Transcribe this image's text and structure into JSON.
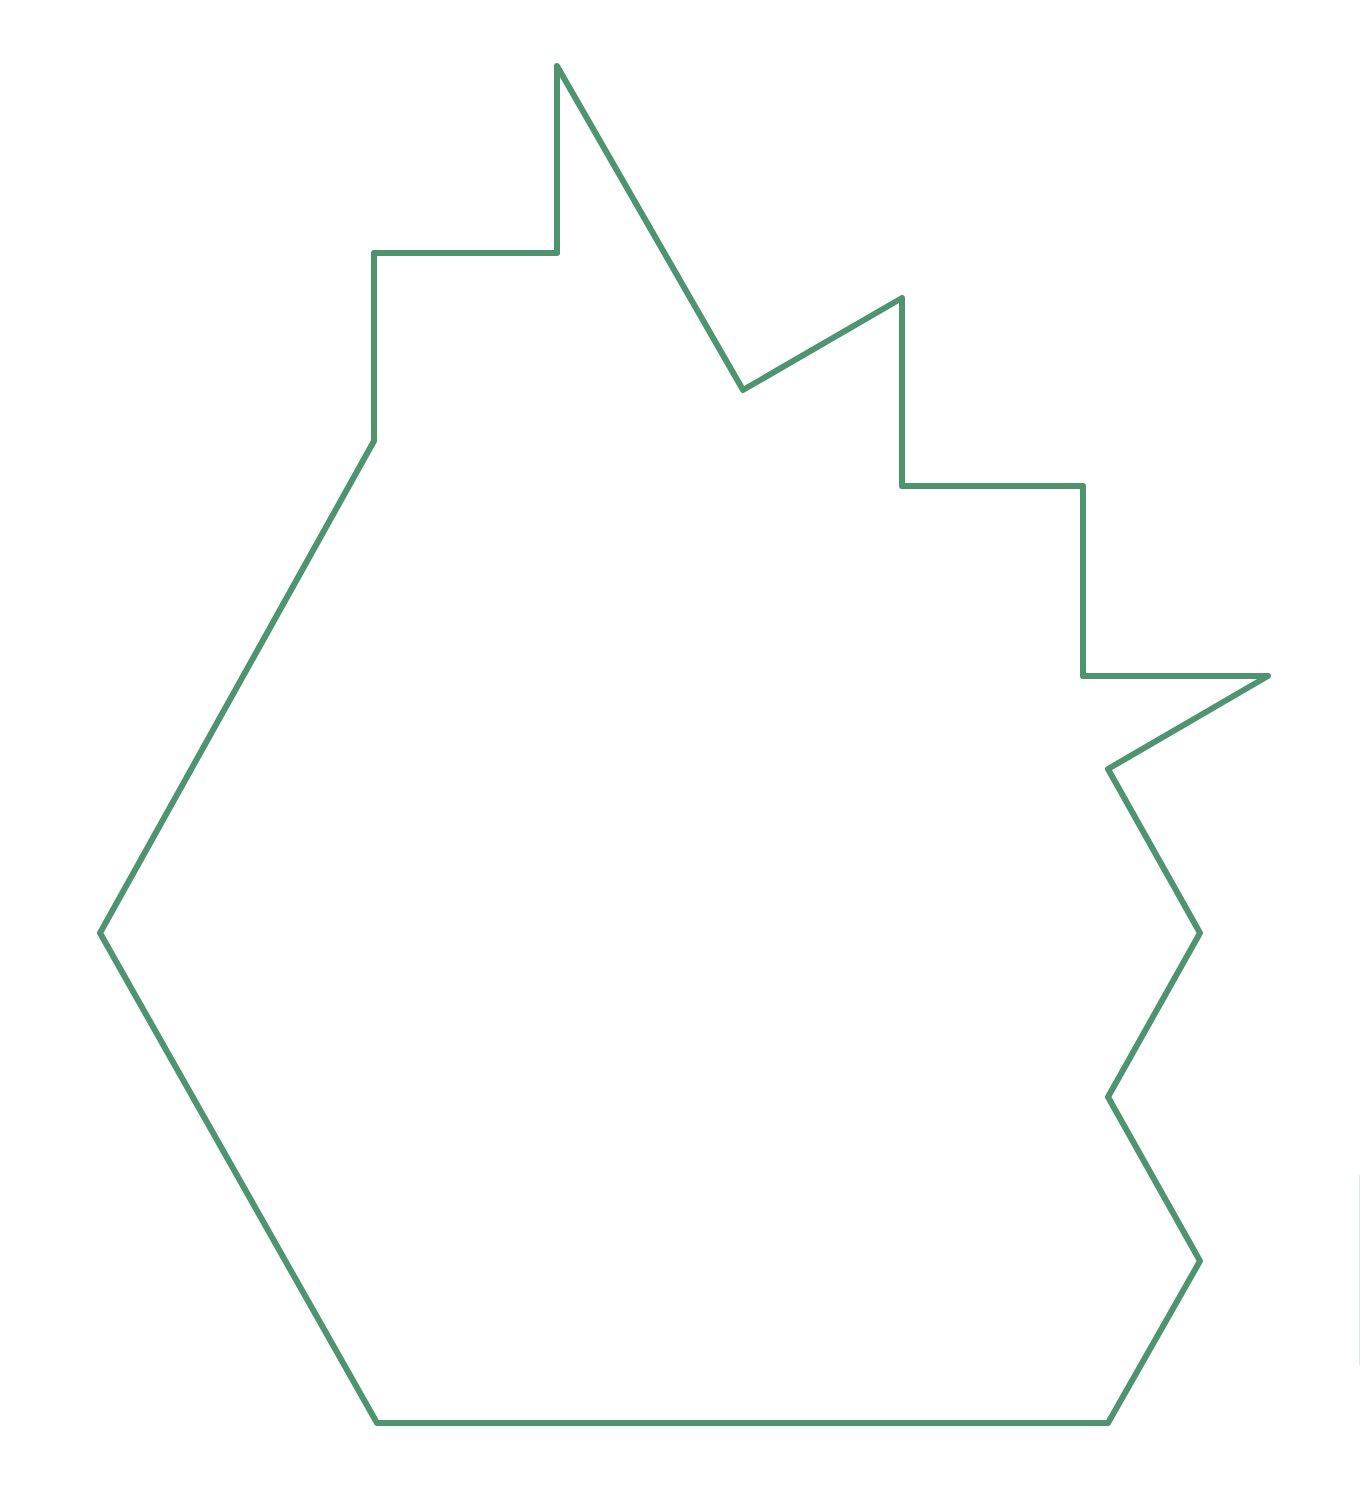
{
  "figure": {
    "type": "polygon-outline",
    "stroke_color": "#4e9470",
    "stroke_width": 6,
    "fill": "none",
    "background": "#ffffff",
    "vertices": [
      [
        557,
        66
      ],
      [
        743,
        390
      ],
      [
        902,
        298
      ],
      [
        902,
        486
      ],
      [
        1083,
        486
      ],
      [
        1083,
        676
      ],
      [
        1268,
        676
      ],
      [
        1108,
        769
      ],
      [
        1200,
        933
      ],
      [
        1108,
        1097
      ],
      [
        1200,
        1261
      ],
      [
        1108,
        1423
      ],
      [
        377,
        1423
      ],
      [
        100,
        933
      ],
      [
        374,
        441
      ],
      [
        374,
        253
      ],
      [
        557,
        253
      ]
    ]
  }
}
